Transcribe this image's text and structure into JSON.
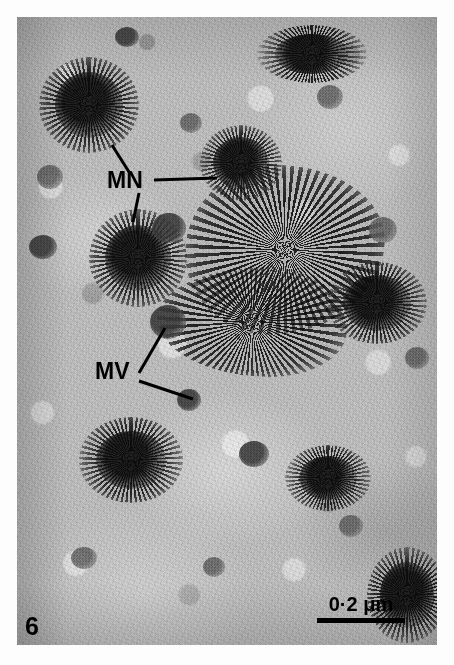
{
  "figure": {
    "number": "6",
    "caption_number_position": "bottom-left",
    "type": "transmission-electron-micrograph",
    "background_color": "#ffffff",
    "plate_color": "#bdbdbd"
  },
  "annotations": [
    {
      "id": "mn",
      "label": "MN",
      "meaning": "mycoplasma nodule",
      "text_x": 90,
      "text_y": 152,
      "leaders": [
        {
          "name": "mn-leader-upper-left",
          "x1": 112,
          "y1": 155,
          "x2": 95,
          "y2": 128
        },
        {
          "name": "mn-leader-right",
          "x1": 137,
          "y1": 163,
          "x2": 200,
          "y2": 161
        },
        {
          "name": "mn-leader-down",
          "x1": 122,
          "y1": 176,
          "x2": 116,
          "y2": 205
        }
      ]
    },
    {
      "id": "mv",
      "label": "MV",
      "meaning": "mycoplasma vesicle",
      "text_x": 78,
      "text_y": 343,
      "leaders": [
        {
          "name": "mv-leader-upper-right",
          "x1": 122,
          "y1": 356,
          "x2": 148,
          "y2": 311
        },
        {
          "name": "mv-leader-lower-right",
          "x1": 122,
          "y1": 364,
          "x2": 176,
          "y2": 382
        }
      ]
    }
  ],
  "scalebar": {
    "label": "0·2 μm",
    "value": 0.2,
    "unit": "μm",
    "bar_length_px": 88,
    "color": "#000000"
  },
  "structures": {
    "nodules": [
      {
        "name": "nodule-top-left",
        "x": 22,
        "y": 40,
        "w": 100,
        "h": 96
      },
      {
        "name": "nodule-upper-mid",
        "x": 183,
        "y": 108,
        "w": 82,
        "h": 76
      },
      {
        "name": "nodule-center-left",
        "x": 72,
        "y": 192,
        "w": 98,
        "h": 98
      },
      {
        "name": "nodule-lower-left",
        "x": 62,
        "y": 400,
        "w": 104,
        "h": 86
      },
      {
        "name": "nodule-right-edge",
        "x": 310,
        "y": 245,
        "w": 100,
        "h": 82
      },
      {
        "name": "nodule-bottom-right",
        "x": 268,
        "y": 428,
        "w": 86,
        "h": 66
      },
      {
        "name": "nodule-top-right",
        "x": 240,
        "y": 8,
        "w": 110,
        "h": 58
      },
      {
        "name": "nodule-corner-br",
        "x": 350,
        "y": 530,
        "w": 80,
        "h": 96
      }
    ],
    "masses": [
      {
        "name": "mass-central-aggregate",
        "x": 168,
        "y": 148,
        "w": 200,
        "h": 170,
        "radius": "46% 54% 58% 42% / 52% 44% 56% 48%"
      },
      {
        "name": "mass-central-lower",
        "x": 140,
        "y": 250,
        "w": 190,
        "h": 110,
        "radius": "58% 42% 40% 60% / 46% 58% 42% 54%"
      }
    ],
    "vesicles": [
      {
        "name": "vesicle-upper-left",
        "x": 20,
        "y": 148,
        "w": 26,
        "h": 24,
        "dark": false
      },
      {
        "name": "vesicle-left-mid",
        "x": 12,
        "y": 218,
        "w": 28,
        "h": 24,
        "dark": true
      },
      {
        "name": "vesicle-annotated-up",
        "x": 135,
        "y": 196,
        "w": 34,
        "h": 30,
        "dark": true
      },
      {
        "name": "vesicle-annotated-mv1",
        "x": 133,
        "y": 288,
        "w": 36,
        "h": 34,
        "dark": true
      },
      {
        "name": "vesicle-annotated-mv2",
        "x": 160,
        "y": 372,
        "w": 24,
        "h": 22,
        "dark": true
      },
      {
        "name": "vesicle-mid-field",
        "x": 163,
        "y": 96,
        "w": 22,
        "h": 20,
        "dark": false
      },
      {
        "name": "vesicle-right-upper",
        "x": 300,
        "y": 68,
        "w": 26,
        "h": 24,
        "dark": false
      },
      {
        "name": "vesicle-right-mid",
        "x": 352,
        "y": 200,
        "w": 28,
        "h": 26,
        "dark": false
      },
      {
        "name": "vesicle-right-low",
        "x": 388,
        "y": 330,
        "w": 24,
        "h": 22,
        "dark": false
      },
      {
        "name": "vesicle-bottom-mid",
        "x": 222,
        "y": 424,
        "w": 30,
        "h": 26,
        "dark": true
      },
      {
        "name": "vesicle-bottom-left",
        "x": 54,
        "y": 530,
        "w": 26,
        "h": 22,
        "dark": false
      },
      {
        "name": "vesicle-bottom-right",
        "x": 322,
        "y": 498,
        "w": 24,
        "h": 22,
        "dark": false
      },
      {
        "name": "vesicle-lower-center",
        "x": 186,
        "y": 540,
        "w": 22,
        "h": 20,
        "dark": false
      },
      {
        "name": "vesicle-top-mid",
        "x": 98,
        "y": 10,
        "w": 24,
        "h": 20,
        "dark": true
      }
    ]
  }
}
